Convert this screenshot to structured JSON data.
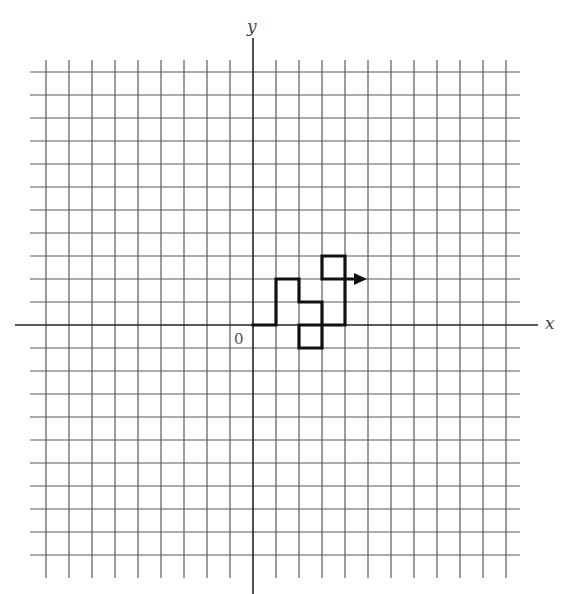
{
  "diagram": {
    "type": "grid-path",
    "axes": {
      "x_label": "x",
      "y_label": "y",
      "origin_label": "0"
    },
    "grid": {
      "cell_px": 23,
      "origin_px": [
        253,
        325
      ],
      "x_min": -9,
      "x_max": 11,
      "y_min": -10,
      "y_max": 11
    },
    "path": {
      "points": [
        [
          0,
          0
        ],
        [
          1,
          0
        ],
        [
          1,
          2
        ],
        [
          2,
          2
        ],
        [
          2,
          1
        ],
        [
          3,
          1
        ],
        [
          3,
          -1
        ],
        [
          2,
          -1
        ],
        [
          2,
          0
        ],
        [
          4,
          0
        ],
        [
          4,
          3
        ],
        [
          3,
          3
        ],
        [
          3,
          2
        ],
        [
          5,
          2
        ]
      ],
      "ends_with_arrow": true
    },
    "colors": {
      "grid": "#5a5a5a",
      "axis": "#222222",
      "path": "#111111",
      "background": "#ffffff"
    }
  }
}
